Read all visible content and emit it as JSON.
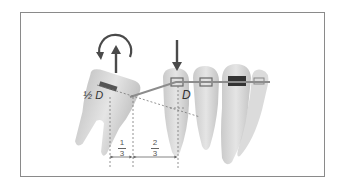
{
  "figure": {
    "type": "orthodontic force diagram",
    "labels": {
      "half_d": "½ D",
      "d": "D",
      "fraction_left": {
        "numerator": "1",
        "denominator": "3"
      },
      "fraction_right": {
        "numerator": "2",
        "denominator": "3"
      }
    },
    "icons": {
      "rotation": "counterclockwise-rotation-arrow",
      "extrusion": "up-arrow",
      "intrusion": "down-arrow"
    },
    "colors": {
      "frame": "#8a8a8a",
      "tooth": "#d4d4d4",
      "tooth_shadow": "#b8b8b8",
      "arrow": "#4a4a4a",
      "wire": "#8c8c8c",
      "dashed": "#777777",
      "bracket": "#555555"
    }
  }
}
